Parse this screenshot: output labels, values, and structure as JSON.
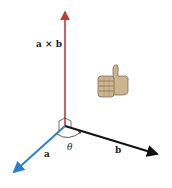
{
  "diagram": {
    "labels": {
      "cross": "a × b",
      "a": "a",
      "b": "b",
      "theta": "θ"
    },
    "colors": {
      "cross_vector": "#c0393b",
      "a_vector": "#2f7fd0",
      "b_vector": "#111111",
      "thumb_skin": "#cdb58f"
    },
    "icon": "thumbs-up-icon"
  }
}
